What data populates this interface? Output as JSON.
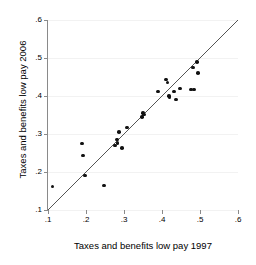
{
  "chart_data": {
    "type": "scatter",
    "title": "",
    "xlabel": "Taxes and benefits low pay 1997",
    "ylabel": "Taxes and benefits low pay 2006",
    "xlim": [
      0.1,
      0.6
    ],
    "ylim": [
      0.1,
      0.6
    ],
    "xticks": [
      0.1,
      0.2,
      0.3,
      0.4,
      0.5,
      0.6
    ],
    "yticks": [
      0.1,
      0.2,
      0.3,
      0.4,
      0.5,
      0.6
    ],
    "xticklabels": [
      ".1",
      ".2",
      ".3",
      ".4",
      ".5",
      ".6"
    ],
    "yticklabels": [
      ".1",
      ".2",
      ".3",
      ".4",
      ".5",
      ".6"
    ],
    "grid": "horizontal",
    "legend": "none",
    "marker": "filled-circle",
    "marker_color": "#111111",
    "reference_line": {
      "name": "45-degree line",
      "from": [
        0.1,
        0.1
      ],
      "to": [
        0.6,
        0.6
      ],
      "color": "#555555"
    },
    "points": [
      {
        "x": 0.112,
        "y": 0.162
      },
      {
        "x": 0.19,
        "y": 0.275
      },
      {
        "x": 0.192,
        "y": 0.243
      },
      {
        "x": 0.198,
        "y": 0.191
      },
      {
        "x": 0.248,
        "y": 0.164
      },
      {
        "x": 0.277,
        "y": 0.27
      },
      {
        "x": 0.281,
        "y": 0.286
      },
      {
        "x": 0.283,
        "y": 0.277
      },
      {
        "x": 0.287,
        "y": 0.305
      },
      {
        "x": 0.295,
        "y": 0.263
      },
      {
        "x": 0.308,
        "y": 0.317
      },
      {
        "x": 0.347,
        "y": 0.345
      },
      {
        "x": 0.35,
        "y": 0.355
      },
      {
        "x": 0.352,
        "y": 0.351
      },
      {
        "x": 0.39,
        "y": 0.412
      },
      {
        "x": 0.411,
        "y": 0.443
      },
      {
        "x": 0.414,
        "y": 0.436
      },
      {
        "x": 0.418,
        "y": 0.4
      },
      {
        "x": 0.42,
        "y": 0.396
      },
      {
        "x": 0.432,
        "y": 0.412
      },
      {
        "x": 0.437,
        "y": 0.391
      },
      {
        "x": 0.447,
        "y": 0.42
      },
      {
        "x": 0.476,
        "y": 0.417
      },
      {
        "x": 0.481,
        "y": 0.475
      },
      {
        "x": 0.484,
        "y": 0.417
      },
      {
        "x": 0.492,
        "y": 0.49
      },
      {
        "x": 0.494,
        "y": 0.46
      }
    ]
  }
}
